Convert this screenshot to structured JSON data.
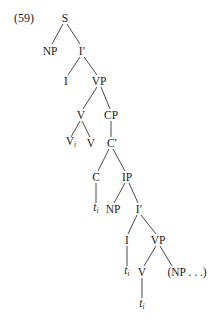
{
  "example_number": "(59)",
  "nodes": {
    "S": {
      "label": "S"
    },
    "NP1": {
      "label": "NP"
    },
    "Ibar1": {
      "label": "I′"
    },
    "I1": {
      "label": "I"
    },
    "VP1": {
      "label": "VP"
    },
    "V1": {
      "label": "V"
    },
    "CP": {
      "label": "CP"
    },
    "Vi": {
      "label": "V",
      "sub": "i"
    },
    "V2": {
      "label": "V"
    },
    "Cbar": {
      "label": "C′"
    },
    "C": {
      "label": "C"
    },
    "IP": {
      "label": "IP"
    },
    "t1": {
      "label": "t",
      "sub": "i"
    },
    "NP2": {
      "label": "NP"
    },
    "Ibar2": {
      "label": "I′"
    },
    "I2": {
      "label": "I"
    },
    "VP2": {
      "label": "VP"
    },
    "t2": {
      "label": "t",
      "sub": "i"
    },
    "V3": {
      "label": "V"
    },
    "NPdots": {
      "label": "(NP . . .)"
    },
    "t3": {
      "label": "t",
      "sub": "i"
    }
  }
}
